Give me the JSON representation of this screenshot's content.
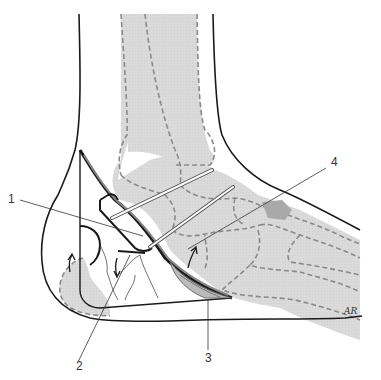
{
  "figure": {
    "type": "anatomical-diagram",
    "colors": {
      "bone_fill": "#d9d9d9",
      "bone_outline": "#8a8a8a",
      "skin_outline": "#1a1a1a",
      "pin_fill": "#ffffff",
      "pin_outline": "#555555",
      "dark_bone_patch": "#a9a9a9",
      "leader_line": "#333333",
      "background": "#ffffff"
    }
  },
  "callouts": [
    {
      "id": "1",
      "text": "1"
    },
    {
      "id": "2",
      "text": "2"
    },
    {
      "id": "3",
      "text": "3"
    },
    {
      "id": "4",
      "text": "4"
    }
  ],
  "signature": {
    "text": "AR"
  }
}
